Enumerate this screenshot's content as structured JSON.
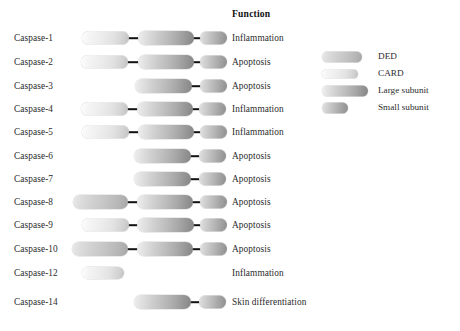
{
  "figure": {
    "function_header": "Function",
    "legend": {
      "items": [
        {
          "key": "ded",
          "label": "DED",
          "swatch_width": 40,
          "swatch_height": 11
        },
        {
          "key": "card",
          "label": "CARD",
          "swatch_width": 36,
          "swatch_height": 9
        },
        {
          "key": "large",
          "label": "Large subunit",
          "swatch_width": 46,
          "swatch_height": 11
        },
        {
          "key": "small",
          "label": "Small subunit",
          "swatch_width": 26,
          "swatch_height": 11
        }
      ]
    },
    "rows": [
      {
        "name": "Caspase-1",
        "function": "Inflammation",
        "domains": [
          {
            "type": "card",
            "x": 82,
            "w": 47,
            "h": 13
          },
          {
            "type": "large",
            "x": 138,
            "w": 56,
            "h": 14
          },
          {
            "type": "small",
            "x": 200,
            "w": 27,
            "h": 13
          }
        ]
      },
      {
        "name": "Caspase-2",
        "function": "Apoptosis",
        "domains": [
          {
            "type": "card",
            "x": 81,
            "w": 47,
            "h": 13
          },
          {
            "type": "large",
            "x": 138,
            "w": 56,
            "h": 14
          },
          {
            "type": "small",
            "x": 200,
            "w": 27,
            "h": 13
          }
        ]
      },
      {
        "name": "Caspase-3",
        "function": "Apoptosis",
        "domains": [
          {
            "type": "large",
            "x": 135,
            "w": 57,
            "h": 14
          },
          {
            "type": "small",
            "x": 200,
            "w": 27,
            "h": 13
          }
        ]
      },
      {
        "name": "Caspase-4",
        "function": "Inflammation",
        "domains": [
          {
            "type": "card",
            "x": 81,
            "w": 47,
            "h": 13
          },
          {
            "type": "large",
            "x": 137,
            "w": 56,
            "h": 14
          },
          {
            "type": "small",
            "x": 199,
            "w": 27,
            "h": 13
          }
        ]
      },
      {
        "name": "Caspase-5",
        "function": "Inflammation",
        "domains": [
          {
            "type": "card",
            "x": 82,
            "w": 47,
            "h": 13
          },
          {
            "type": "large",
            "x": 138,
            "w": 56,
            "h": 14
          },
          {
            "type": "small",
            "x": 200,
            "w": 27,
            "h": 13
          }
        ]
      },
      {
        "name": "Caspase-6",
        "function": "Apoptosis",
        "domains": [
          {
            "type": "large",
            "x": 134,
            "w": 57,
            "h": 14
          },
          {
            "type": "small",
            "x": 199,
            "w": 27,
            "h": 13
          }
        ]
      },
      {
        "name": "Caspase-7",
        "function": "Apoptosis",
        "domains": [
          {
            "type": "large",
            "x": 134,
            "w": 57,
            "h": 14
          },
          {
            "type": "small",
            "x": 199,
            "w": 27,
            "h": 13
          }
        ]
      },
      {
        "name": "Caspase-8",
        "function": "Apoptosis",
        "domains": [
          {
            "type": "ded",
            "x": 73,
            "w": 55,
            "h": 14
          },
          {
            "type": "large",
            "x": 137,
            "w": 56,
            "h": 14
          },
          {
            "type": "small",
            "x": 200,
            "w": 27,
            "h": 13
          }
        ]
      },
      {
        "name": "Caspase-9",
        "function": "Apoptosis",
        "domains": [
          {
            "type": "card",
            "x": 82,
            "w": 47,
            "h": 13
          },
          {
            "type": "large",
            "x": 137,
            "w": 57,
            "h": 14
          },
          {
            "type": "small",
            "x": 200,
            "w": 27,
            "h": 13
          }
        ]
      },
      {
        "name": "Caspase-10",
        "function": "Apoptosis",
        "domains": [
          {
            "type": "ded",
            "x": 72,
            "w": 56,
            "h": 14
          },
          {
            "type": "large",
            "x": 137,
            "w": 56,
            "h": 14
          },
          {
            "type": "small",
            "x": 200,
            "w": 27,
            "h": 13
          }
        ]
      },
      {
        "name": "Caspase-12",
        "function": "Inflammation",
        "domains": [
          {
            "type": "card",
            "x": 82,
            "w": 42,
            "h": 12
          }
        ]
      },
      {
        "name": "Caspase-14",
        "function": "Skin differentiation",
        "domains": [
          {
            "type": "large",
            "x": 134,
            "w": 57,
            "h": 14
          },
          {
            "type": "small",
            "x": 199,
            "w": 27,
            "h": 13
          }
        ]
      }
    ],
    "row_tops": [
      27,
      51,
      75,
      98,
      121,
      145,
      168,
      191,
      214,
      238,
      262,
      291
    ]
  }
}
